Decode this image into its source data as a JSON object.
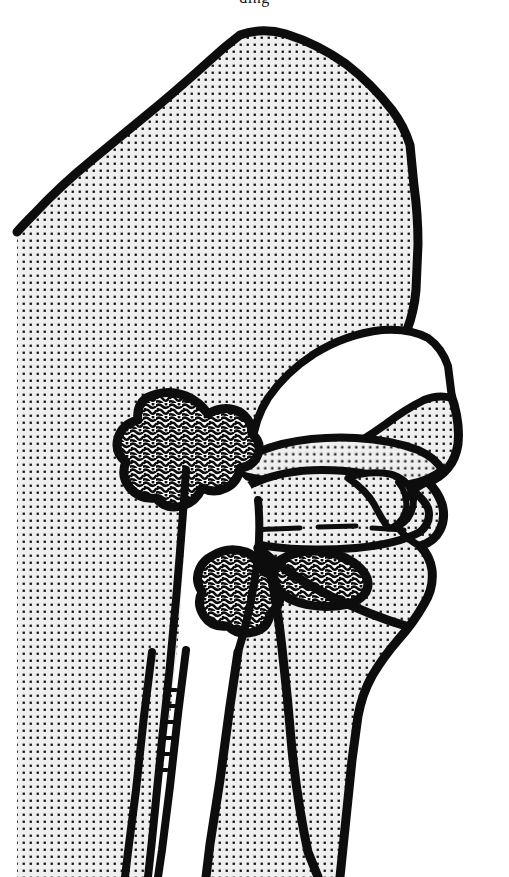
{
  "figure": {
    "caption_remnant_text": "ding",
    "background_color": "#ffffff",
    "ink_color": "#0d0d0d",
    "tissue_fill_color": "#ededed",
    "stipple_dot_color": "#141414",
    "airway_fill_color": "#ffffff",
    "technique": "stippled pen-and-ink line drawing",
    "view": "left lateral midsagittal section, subject facing right",
    "canvas": {
      "width": 509,
      "height": 877
    }
  },
  "structures": [
    {
      "id": "cranium-scalp",
      "name": "Cranium and scalp (stippled soft tissue mass)",
      "fill": "stipple",
      "approx_extent": {
        "x": 17,
        "y": 25,
        "width": 420,
        "height": 835
      }
    },
    {
      "id": "nasal-cavity",
      "name": "Nasal cavity airway",
      "fill": "white",
      "approx_extent": {
        "x": 250,
        "y": 330,
        "width": 205,
        "height": 130
      }
    },
    {
      "id": "hard-palate",
      "name": "Hard palate",
      "fill": "stipple",
      "approx_extent": {
        "x": 232,
        "y": 440,
        "width": 200,
        "height": 45
      }
    },
    {
      "id": "soft-palate",
      "name": "Soft palate and uvula",
      "fill": "stipple",
      "approx_extent": {
        "x": 222,
        "y": 440,
        "width": 120,
        "height": 55
      }
    },
    {
      "id": "tongue",
      "name": "Tongue",
      "fill": "stipple",
      "approx_extent": {
        "x": 215,
        "y": 470,
        "width": 215,
        "height": 80
      }
    },
    {
      "id": "oral-cavity",
      "name": "Oral cavity airway",
      "fill": "white",
      "approx_extent": {
        "x": 235,
        "y": 470,
        "width": 190,
        "height": 40
      }
    },
    {
      "id": "adenoid",
      "name": "Adenoid (pharyngeal tonsil) — enlarged lymphoid tissue",
      "fill": "mottled-lymphoid",
      "approx_extent": {
        "x": 118,
        "y": 393,
        "width": 135,
        "height": 115
      }
    },
    {
      "id": "palatine-tonsil",
      "name": "Palatine tonsil — lymphoid tissue",
      "fill": "mottled-lymphoid",
      "approx_extent": {
        "x": 196,
        "y": 550,
        "width": 105,
        "height": 85
      }
    },
    {
      "id": "lingual-tonsil",
      "name": "Lingual tonsil — lymphoid tissue",
      "fill": "mottled-lymphoid",
      "approx_extent": {
        "x": 268,
        "y": 548,
        "width": 100,
        "height": 55
      }
    },
    {
      "id": "nasopharynx",
      "name": "Nasopharynx / oropharynx airway",
      "fill": "white",
      "approx_extent": {
        "x": 170,
        "y": 460,
        "width": 90,
        "height": 180
      }
    },
    {
      "id": "pharynx-esophagus",
      "name": "Pharynx and esophagus (neck channel)",
      "fill": "white",
      "approx_extent": {
        "x": 120,
        "y": 640,
        "width": 110,
        "height": 237
      }
    },
    {
      "id": "cervical-spine",
      "name": "Cervical vertebral column line",
      "fill": "line",
      "approx_extent": {
        "x": 150,
        "y": 650,
        "width": 40,
        "height": 220
      }
    },
    {
      "id": "nose-profile",
      "name": "External nose profile",
      "fill": "stipple",
      "approx_extent": {
        "x": 400,
        "y": 330,
        "width": 60,
        "height": 160
      }
    },
    {
      "id": "lips-chin",
      "name": "Lips and chin profile",
      "fill": "stipple",
      "approx_extent": {
        "x": 400,
        "y": 460,
        "width": 60,
        "height": 190
      }
    }
  ]
}
